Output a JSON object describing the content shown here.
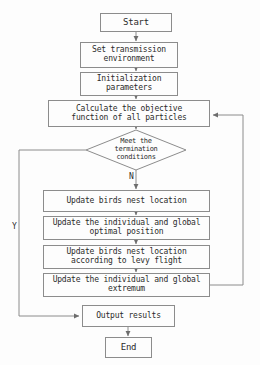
{
  "diagram": {
    "background_color": "#fdfdfd",
    "line_color": "#8c8c8c",
    "text_color": "#2b2b2b"
  },
  "nodes": {
    "start": {
      "label": "Start",
      "shape": "process"
    },
    "set_environment": {
      "label": "Set transmission\nenvironment",
      "shape": "process"
    },
    "initialization": {
      "label": "Initialization\nparameters",
      "shape": "process"
    },
    "calculate_objective": {
      "label": "Calculate the objective\nfunction of all particles",
      "shape": "process"
    },
    "termination_decision": {
      "label": "Meet the\ntermination\nconditions",
      "shape": "decision"
    },
    "update_nest_location": {
      "label": "Update birds nest location",
      "shape": "process"
    },
    "update_optimal_position": {
      "label": "Update the individual and global\noptimal position",
      "shape": "process"
    },
    "update_nest_levy": {
      "label": "Update birds nest location\naccording to levy flight",
      "shape": "process"
    },
    "update_extremum": {
      "label": "Update the individual and global\nextremum",
      "shape": "process"
    },
    "output_results": {
      "label": "Output results",
      "shape": "process"
    },
    "end": {
      "label": "End",
      "shape": "process"
    }
  },
  "branch_labels": {
    "no": "N",
    "yes": "Y"
  }
}
